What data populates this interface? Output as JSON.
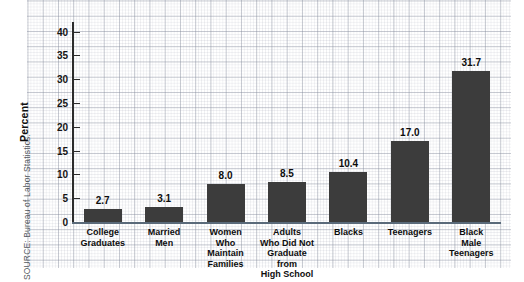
{
  "source_note": "SOURCE: Bureau of Labor Statistics.",
  "chart_data": {
    "type": "bar",
    "title": "",
    "xlabel": "",
    "ylabel": "Percent",
    "ylim": [
      0,
      40
    ],
    "yticks": [
      0,
      5,
      10,
      15,
      20,
      25,
      30,
      35,
      40
    ],
    "grid": true,
    "legend": "none",
    "bar_color": "#3c3c3c",
    "categories": [
      "College Graduates",
      "Married Men",
      "Women Who Maintain Families",
      "Adults Who Did Not Graduate from High School",
      "Blacks",
      "Teenagers",
      "Black Male Teenagers"
    ],
    "category_lines": [
      [
        "College",
        "Graduates"
      ],
      [
        "Married",
        "Men"
      ],
      [
        "Women",
        "Who",
        "Maintain",
        "Families"
      ],
      [
        "Adults",
        "Who Did Not",
        "Graduate from",
        "High School"
      ],
      [
        "Blacks"
      ],
      [
        "Teenagers"
      ],
      [
        "Black",
        "Male",
        "Teenagers"
      ]
    ],
    "values": [
      2.7,
      3.1,
      8.0,
      8.5,
      10.4,
      17.0,
      31.7
    ],
    "value_labels": [
      "2.7",
      "3.1",
      "8.0",
      "8.5",
      "10.4",
      "17.0",
      "31.7"
    ]
  }
}
